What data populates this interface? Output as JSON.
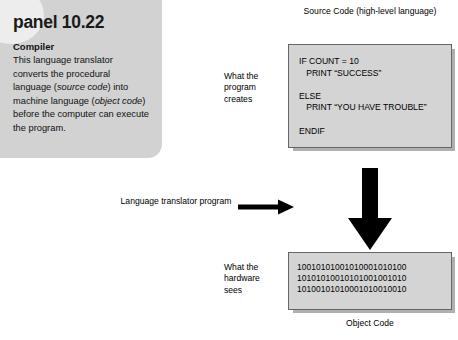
{
  "panel": {
    "title": "panel 10.22",
    "subtitle": "Compiler",
    "body_html": "This language translator converts the procedural language (<i>source code</i>) into machine language (<i>object code</i>) before the computer can execute the program.",
    "background_color": "#d2d2d2"
  },
  "source": {
    "caption": "Source Code\n(high-level language)",
    "code": "IF COUNT = 10\n   PRINT “SUCCESS”\n\nELSE\n   PRINT “YOU HAVE TROUBLE”\n\nENDIF",
    "side_label": "What the\nprogram\ncreates",
    "box_color": "#d4d4d4"
  },
  "object": {
    "caption": "Object Code",
    "code": "10010101001010001010100\n10101010010101001001010\n10100101010001010010010",
    "side_label": "What the\nhardware\nsees",
    "box_color": "#d4d4d4"
  },
  "translator": {
    "label": "Language translator\nprogram"
  },
  "icons": {
    "arrow_right": "arrow-right-icon",
    "arrow_down": "arrow-down-icon"
  }
}
